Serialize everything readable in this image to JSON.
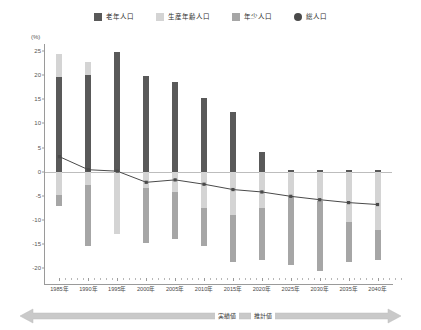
{
  "legend": {
    "items": [
      {
        "label": "老年人口",
        "color": "#595959",
        "marker": "square",
        "name": "legend-elderly"
      },
      {
        "label": "生産年齢人口",
        "color": "#d4d4d4",
        "marker": "square",
        "name": "legend-working-age"
      },
      {
        "label": "年少人口",
        "color": "#a6a6a6",
        "marker": "square",
        "name": "legend-youth"
      },
      {
        "label": "総人口",
        "color": "#4a4a4a",
        "marker": "circle",
        "name": "legend-total"
      }
    ]
  },
  "axis": {
    "unit_label": "(%)",
    "y_ticks": [
      25,
      20,
      15,
      10,
      5,
      0,
      -5,
      -10,
      -15,
      -20
    ],
    "y_min": -22,
    "y_max": 26
  },
  "annotation": {
    "actual_label": "実績値",
    "estimate_label": "推計値"
  },
  "chart_data": {
    "type": "bar",
    "title": "",
    "subtitle": "",
    "xlabel": "",
    "ylabel": "(%)",
    "ylim": [
      -22,
      26
    ],
    "grid": false,
    "legend_position": "top-center",
    "categories": [
      "1985年",
      "1990年",
      "1995年",
      "2000年",
      "2005年",
      "2010年",
      "2015年",
      "2020年",
      "2025年",
      "2030年",
      "2035年",
      "2040年"
    ],
    "series": [
      {
        "name": "老年人口",
        "color": "#595959",
        "type": "bar-segment",
        "values": [
          19.5,
          19.9,
          24.7,
          19.8,
          18.5,
          15.2,
          12.3,
          4.1,
          -0.3,
          -0.8,
          -0.3,
          0.3
        ]
      },
      {
        "name": "生産年齢人口",
        "color": "#d4d4d4",
        "type": "bar-segment",
        "values": [
          4.9,
          2.7,
          -12.8,
          -14.8,
          -13.9,
          -15.4,
          -18.6,
          -18.2,
          -19.3,
          -20.5,
          -18.7,
          -18.2
        ]
      },
      {
        "name": "年少人口",
        "color": "#a6a6a6",
        "type": "bar-segment",
        "values": [
          -7.1,
          -15.4,
          -12.8,
          -14.8,
          -13.9,
          -15.4,
          -9.0,
          -7.5,
          -5.0,
          -6.0,
          -10.4,
          -12.1
        ]
      },
      {
        "name": "総人口",
        "color": "#4a4a4a",
        "type": "line",
        "values": [
          3.1,
          0.4,
          0.1,
          -2.2,
          -1.7,
          -2.6,
          -3.7,
          -4.2,
          -5.1,
          -5.8,
          -6.4,
          -6.8
        ]
      }
    ],
    "bars": [
      {
        "category": "1985年",
        "pos_top": 24.4,
        "pos_dark_from": 0,
        "pos_dark_to": 19.5,
        "neg_light_from": 0,
        "neg_light_to": -4.9,
        "neg_mid_from": -4.9,
        "neg_mid_to": -7.1
      },
      {
        "category": "1990年",
        "pos_top": 22.6,
        "pos_dark_from": 0,
        "pos_dark_to": 19.9,
        "neg_light_from": 0,
        "neg_light_to": -2.7,
        "neg_mid_from": -2.7,
        "neg_mid_to": -15.4
      },
      {
        "category": "1995年",
        "pos_top": 24.7,
        "pos_dark_from": 0,
        "pos_dark_to": 24.7,
        "neg_light_from": 0,
        "neg_light_to": -12.8,
        "neg_mid_from": -12.8,
        "neg_mid_to": -12.8
      },
      {
        "category": "2000年",
        "pos_top": 19.8,
        "pos_dark_from": 0,
        "pos_dark_to": 19.8,
        "neg_light_from": 0,
        "neg_light_to": -3.4,
        "neg_mid_from": -3.4,
        "neg_mid_to": -14.8
      },
      {
        "category": "2005年",
        "pos_top": 18.5,
        "pos_dark_from": 0,
        "pos_dark_to": 18.5,
        "neg_light_from": 0,
        "neg_light_to": -4.2,
        "neg_mid_from": -4.2,
        "neg_mid_to": -13.9
      },
      {
        "category": "2010年",
        "pos_top": 15.2,
        "pos_dark_from": 0,
        "pos_dark_to": 15.2,
        "neg_light_from": 0,
        "neg_light_to": -7.5,
        "neg_mid_from": -7.5,
        "neg_mid_to": -15.4
      },
      {
        "category": "2015年",
        "pos_top": 12.3,
        "pos_dark_from": 0,
        "pos_dark_to": 12.3,
        "neg_light_from": 0,
        "neg_light_to": -9.0,
        "neg_mid_from": -9.0,
        "neg_mid_to": -18.6
      },
      {
        "category": "2020年",
        "pos_top": 4.1,
        "pos_dark_from": 0,
        "pos_dark_to": 4.1,
        "neg_light_from": 0,
        "neg_light_to": -7.5,
        "neg_mid_from": -7.5,
        "neg_mid_to": -18.2
      },
      {
        "category": "2025年",
        "pos_top": 0.3,
        "pos_dark_from": 0,
        "pos_dark_to": 0.3,
        "neg_light_from": 0,
        "neg_light_to": -5.0,
        "neg_mid_from": -5.0,
        "neg_mid_to": -19.3
      },
      {
        "category": "2030年",
        "pos_top": 0.4,
        "pos_dark_from": 0,
        "pos_dark_to": 0.4,
        "neg_light_from": 0,
        "neg_light_to": -6.0,
        "neg_mid_from": -6.0,
        "neg_mid_to": -20.5
      },
      {
        "category": "2035年",
        "pos_top": 0.3,
        "pos_dark_from": 0,
        "pos_dark_to": 0.3,
        "neg_light_from": 0,
        "neg_light_to": -10.4,
        "neg_mid_from": -10.4,
        "neg_mid_to": -18.7
      },
      {
        "category": "2040年",
        "pos_top": 0.3,
        "pos_dark_from": 0,
        "pos_dark_to": 0.3,
        "neg_light_from": 0,
        "neg_light_to": -12.1,
        "neg_mid_from": -12.1,
        "neg_mid_to": -18.2
      }
    ]
  }
}
